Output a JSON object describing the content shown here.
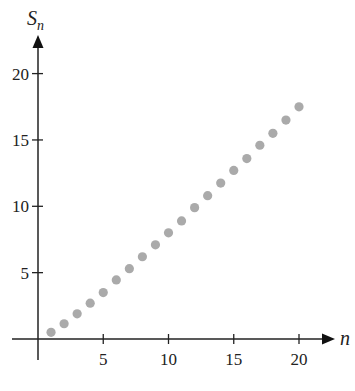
{
  "chart_data": {
    "type": "scatter",
    "title": "",
    "xlabel": "n",
    "ylabel": "S_n",
    "ylabel_main": "S",
    "ylabel_sub": "n",
    "xlim": [
      0,
      21
    ],
    "ylim": [
      0,
      21
    ],
    "x_ticks": [
      5,
      10,
      15,
      20
    ],
    "y_ticks": [
      5,
      10,
      15,
      20
    ],
    "grid": false,
    "legend": null,
    "marker_color": "#aaaaaa",
    "x": [
      1,
      2,
      3,
      4,
      5,
      6,
      7,
      8,
      9,
      10,
      11,
      12,
      13,
      14,
      15,
      16,
      17,
      18,
      19,
      20
    ],
    "values": [
      0.5,
      1.15,
      1.9,
      2.7,
      3.5,
      4.45,
      5.3,
      6.2,
      7.1,
      8.0,
      8.9,
      9.9,
      10.8,
      11.75,
      12.7,
      13.6,
      14.6,
      15.5,
      16.5,
      17.5
    ]
  }
}
